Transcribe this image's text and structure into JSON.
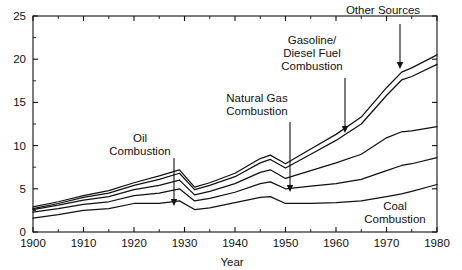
{
  "chart_data": {
    "type": "area",
    "title": "",
    "subtitle": "",
    "xlabel": "Year",
    "ylabel": "",
    "xlim": [
      1900,
      1980
    ],
    "ylim": [
      0,
      25
    ],
    "xticks": [
      1900,
      1910,
      1920,
      1930,
      1940,
      1950,
      1960,
      1970,
      1980
    ],
    "xtick_labels": [
      "1900",
      "1910",
      "1920",
      "1930",
      "1940",
      "1950",
      "1960",
      "1970",
      "1980"
    ],
    "yticks": [
      0,
      5,
      10,
      15,
      20,
      25
    ],
    "ytick_labels": [
      "0",
      "5",
      "10",
      "15",
      "20",
      "25"
    ],
    "minor_xtick_interval": 5,
    "grid": false,
    "legend_position": "inline-annotations",
    "stacked": true,
    "x": [
      1900,
      1905,
      1910,
      1915,
      1920,
      1925,
      1929,
      1932,
      1935,
      1940,
      1945,
      1947,
      1950,
      1955,
      1960,
      1965,
      1970,
      1973,
      1975,
      1980
    ],
    "series": [
      {
        "name": "Coal Combustion",
        "cumulative_values": [
          1.6,
          2.0,
          2.5,
          2.7,
          3.3,
          3.3,
          3.6,
          2.6,
          2.8,
          3.4,
          4.0,
          4.1,
          3.3,
          3.3,
          3.4,
          3.6,
          4.1,
          4.4,
          4.7,
          5.5
        ]
      },
      {
        "name": "Coal + Oil Combustion",
        "cumulative_values": [
          2.3,
          2.7,
          3.2,
          3.5,
          4.2,
          4.5,
          5.0,
          3.6,
          3.9,
          4.6,
          5.6,
          5.8,
          5.0,
          5.3,
          5.6,
          6.1,
          7.1,
          7.7,
          7.9,
          8.6
        ]
      },
      {
        "name": "+ Natural Gas Combustion",
        "cumulative_values": [
          2.6,
          3.1,
          3.7,
          4.1,
          4.9,
          5.4,
          6.0,
          4.3,
          4.7,
          5.6,
          6.9,
          7.2,
          6.2,
          7.1,
          8.0,
          9.0,
          10.9,
          11.6,
          11.7,
          12.2
        ]
      },
      {
        "name": "+ Gasoline/Diesel Fuel Combustion",
        "cumulative_values": [
          2.7,
          3.3,
          4.0,
          4.5,
          5.4,
          6.1,
          6.8,
          4.9,
          5.4,
          6.4,
          8.0,
          8.4,
          7.4,
          9.0,
          10.6,
          12.5,
          15.8,
          17.6,
          18.0,
          19.4
        ]
      },
      {
        "name": "+ Other Sources",
        "cumulative_values": [
          2.9,
          3.5,
          4.2,
          4.8,
          5.7,
          6.5,
          7.2,
          5.2,
          5.7,
          6.8,
          8.5,
          8.9,
          7.9,
          9.6,
          11.3,
          13.3,
          16.7,
          18.5,
          19.0,
          20.5
        ]
      }
    ],
    "annotations": [
      {
        "label": "Oil Combustion",
        "lines": [
          "Oil",
          "Combustion"
        ],
        "text_x": 140,
        "text_y": 142,
        "arrow_from_x": 174,
        "arrow_from_y": 158,
        "arrow_to_x": 174,
        "arrow_to_y": 206
      },
      {
        "label": "Natural Gas Combustion",
        "lines": [
          "Natural Gas",
          "Combustion"
        ],
        "text_x": 257,
        "text_y": 102,
        "arrow_from_x": 290,
        "arrow_from_y": 122,
        "arrow_to_x": 290,
        "arrow_to_y": 192
      },
      {
        "label": "Gasoline/Diesel Fuel Combustion",
        "lines": [
          "Gasoline/",
          "Diesel Fuel",
          "Combustion"
        ],
        "text_x": 312,
        "text_y": 44,
        "arrow_from_x": 345,
        "arrow_from_y": 78,
        "arrow_to_x": 345,
        "arrow_to_y": 133
      },
      {
        "label": "Other Sources",
        "lines": [
          "Other Sources"
        ],
        "text_x": 383,
        "text_y": 14,
        "arrow_from_x": 400,
        "arrow_from_y": 24,
        "arrow_to_x": 400,
        "arrow_to_y": 69
      },
      {
        "label": "Coal Combustion",
        "lines": [
          "Coal",
          "Combustion"
        ],
        "text_x": 395,
        "text_y": 210,
        "arrow_from_x": null,
        "arrow_from_y": null,
        "arrow_to_x": null,
        "arrow_to_y": null
      }
    ],
    "colors": {
      "line": "#111111",
      "axis": "#111111",
      "background": "#ffffff",
      "text": "#111111"
    }
  }
}
